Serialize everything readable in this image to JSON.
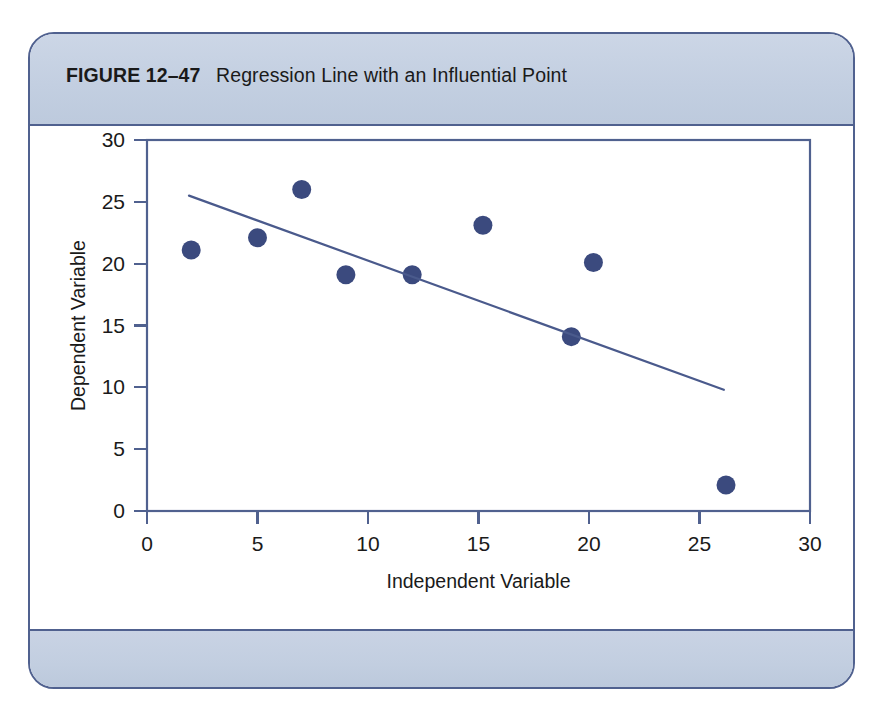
{
  "figure": {
    "label": "FIGURE 12–47",
    "caption": "Regression Line with an Influential Point",
    "full_caption": "FIGURE 12–47  Regression Line with an Influential Point"
  },
  "colors": {
    "frame_border": "#50618f",
    "band_fill": "#c5d0e2",
    "axis": "#50618f",
    "marker": "#3b4a7e",
    "regression_line": "#4a5a8c",
    "plot_background": "#ffffff"
  },
  "chart_data": {
    "type": "scatter",
    "title": "Regression Line with an Influential Point",
    "xlabel": "Independent Variable",
    "ylabel": "Dependent Variable",
    "xlim": [
      0,
      30
    ],
    "ylim": [
      0,
      30
    ],
    "xticks": [
      0,
      5,
      10,
      15,
      20,
      25,
      30
    ],
    "yticks": [
      0,
      5,
      10,
      15,
      20,
      25,
      30
    ],
    "xtick_labels": [
      "0",
      "5",
      "10",
      "15",
      "20",
      "25",
      "30"
    ],
    "ytick_labels": [
      "0",
      "5",
      "10",
      "15",
      "20",
      "25",
      "30"
    ],
    "grid": false,
    "legend": false,
    "series": [
      {
        "name": "Observations",
        "marker": "circle",
        "points": [
          {
            "x": 2.0,
            "y": 21.1
          },
          {
            "x": 5.0,
            "y": 22.1
          },
          {
            "x": 7.0,
            "y": 26.0
          },
          {
            "x": 9.0,
            "y": 19.1
          },
          {
            "x": 12.0,
            "y": 19.1
          },
          {
            "x": 15.2,
            "y": 23.1
          },
          {
            "x": 19.2,
            "y": 14.1
          },
          {
            "x": 20.2,
            "y": 20.1
          },
          {
            "x": 26.2,
            "y": 2.1
          }
        ]
      },
      {
        "name": "Regression line",
        "type": "line",
        "points": [
          {
            "x": 1.9,
            "y": 25.5
          },
          {
            "x": 26.1,
            "y": 9.8
          }
        ]
      }
    ],
    "annotations": [
      {
        "text": "Influential point",
        "x": 26.2,
        "y": 2.1,
        "shown": false
      }
    ]
  }
}
